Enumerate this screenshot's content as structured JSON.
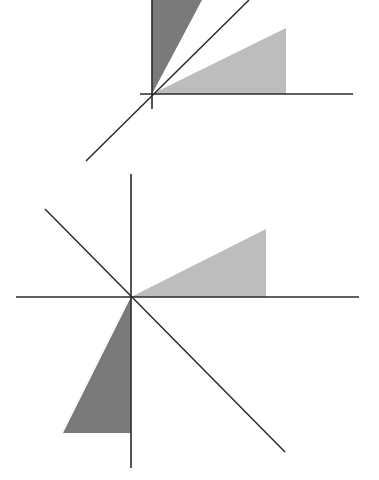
{
  "colors": {
    "background": "#ffffff",
    "axis": "#2b2b2b",
    "light_triangle": "#bdbdbd",
    "dark_triangle": "#7a7a7a"
  },
  "figures": [
    {
      "name": "reflection-across-y-equals-x",
      "origin": [
        152,
        94
      ],
      "x_axis": [
        [
          140,
          94
        ],
        [
          353,
          94
        ]
      ],
      "y_axis": [
        [
          152,
          0
        ],
        [
          152,
          109
        ]
      ],
      "mirror_line": [
        [
          86,
          161
        ],
        [
          249,
          0
        ]
      ],
      "light_triangle": [
        [
          152,
          94
        ],
        [
          286,
          28
        ],
        [
          286,
          94
        ]
      ],
      "dark_triangle": [
        [
          152,
          94
        ],
        [
          152,
          0
        ],
        [
          202,
          0
        ]
      ]
    },
    {
      "name": "reflection-across-y-equals-minus-x",
      "origin": [
        131,
        297
      ],
      "x_axis": [
        [
          16,
          297
        ],
        [
          359,
          297
        ]
      ],
      "y_axis": [
        [
          131,
          174
        ],
        [
          131,
          468
        ]
      ],
      "mirror_line": [
        [
          45,
          209
        ],
        [
          285,
          452
        ]
      ],
      "light_triangle": [
        [
          131,
          297
        ],
        [
          266,
          229
        ],
        [
          266,
          297
        ]
      ],
      "dark_triangle": [
        [
          131,
          297
        ],
        [
          131,
          433
        ],
        [
          63,
          433
        ]
      ]
    }
  ]
}
